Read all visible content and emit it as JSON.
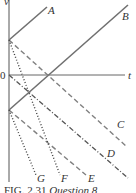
{
  "figure": {
    "axes": {
      "y_label": "v",
      "x_label": "t",
      "origin_label": "0"
    },
    "lines": [
      {
        "id": "A",
        "label": "A",
        "style": "solid",
        "color": "#707070"
      },
      {
        "id": "B",
        "label": "B",
        "style": "solid",
        "color": "#707070"
      },
      {
        "id": "C",
        "label": "C",
        "style": "dashed",
        "color": "#808080"
      },
      {
        "id": "D",
        "label": "D",
        "style": "dash-dot",
        "color": "#555555"
      },
      {
        "id": "E",
        "label": "E",
        "style": "dashed",
        "color": "#808080"
      },
      {
        "id": "F",
        "label": "F",
        "style": "dotted",
        "color": "#444444"
      },
      {
        "id": "G",
        "label": "G",
        "style": "dotted",
        "color": "#444444"
      }
    ],
    "caption": {
      "fig_label": "FIG. 2.31",
      "text": "Question 8"
    }
  }
}
